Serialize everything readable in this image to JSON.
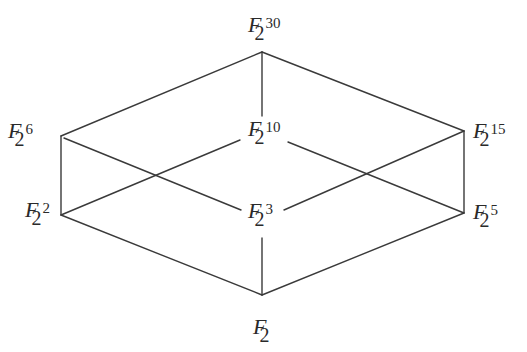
{
  "diagram": {
    "nodes": [
      {
        "id": "n30",
        "field": "F",
        "base": "2",
        "exp": "30",
        "x": 262,
        "y": 52,
        "label_x": 248,
        "label_y": 14
      },
      {
        "id": "n6",
        "field": "F",
        "base": "2",
        "exp": "6",
        "x": 61,
        "y": 136,
        "label_x": 8,
        "label_y": 120
      },
      {
        "id": "n10",
        "field": "F",
        "base": "2",
        "exp": "10",
        "x": 262,
        "y": 136,
        "label_x": 248,
        "label_y": 118
      },
      {
        "id": "n15",
        "field": "F",
        "base": "2",
        "exp": "15",
        "x": 464,
        "y": 131,
        "label_x": 473,
        "label_y": 120
      },
      {
        "id": "n2",
        "field": "F",
        "base": "2",
        "exp": "2",
        "x": 61,
        "y": 215,
        "label_x": 25,
        "label_y": 199
      },
      {
        "id": "n3",
        "field": "F",
        "base": "2",
        "exp": "3",
        "x": 262,
        "y": 215,
        "label_x": 248,
        "label_y": 200
      },
      {
        "id": "n5",
        "field": "F",
        "base": "2",
        "exp": "5",
        "x": 464,
        "y": 213,
        "label_x": 473,
        "label_y": 201
      },
      {
        "id": "n1",
        "field": "F",
        "base": "2",
        "exp": "",
        "x": 262,
        "y": 295,
        "label_x": 253,
        "label_y": 316
      }
    ],
    "edges": [
      {
        "from": "n30",
        "to": "n6",
        "x1": 262,
        "y1": 52,
        "x2": 61,
        "y2": 136
      },
      {
        "from": "n30",
        "to": "n15",
        "x1": 262,
        "y1": 52,
        "x2": 464,
        "y2": 131
      },
      {
        "from": "n30",
        "to": "n10",
        "x1": 262,
        "y1": 52,
        "x2": 262,
        "y2": 116
      },
      {
        "from": "n6",
        "to": "n2",
        "x1": 61,
        "y1": 136,
        "x2": 61,
        "y2": 215
      },
      {
        "from": "n6",
        "to": "n3",
        "x1": 64,
        "y1": 138,
        "x2": 241,
        "y2": 210
      },
      {
        "from": "n10",
        "to": "n2",
        "x1": 240,
        "y1": 140,
        "x2": 61,
        "y2": 215
      },
      {
        "from": "n10",
        "to": "n5",
        "x1": 288,
        "y1": 142,
        "x2": 464,
        "y2": 213
      },
      {
        "from": "n15",
        "to": "n3",
        "x1": 464,
        "y1": 131,
        "x2": 284,
        "y2": 210
      },
      {
        "from": "n15",
        "to": "n5",
        "x1": 464,
        "y1": 131,
        "x2": 464,
        "y2": 213
      },
      {
        "from": "n2",
        "to": "n1",
        "x1": 61,
        "y1": 215,
        "x2": 262,
        "y2": 295
      },
      {
        "from": "n5",
        "to": "n1",
        "x1": 464,
        "y1": 213,
        "x2": 262,
        "y2": 295
      },
      {
        "from": "n3",
        "to": "n1",
        "x1": 262,
        "y1": 238,
        "x2": 262,
        "y2": 295
      }
    ],
    "colors": {
      "stroke": "#3a3a3a",
      "text": "#2a2a2a",
      "background": "#ffffff"
    }
  }
}
